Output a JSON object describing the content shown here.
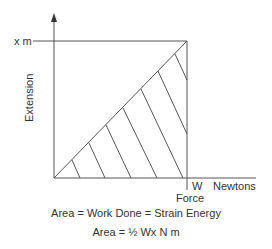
{
  "diagram": {
    "y_axis": {
      "label": "Extension",
      "tick_label": "x m"
    },
    "x_axis": {
      "label": "Force",
      "tick_label": "W",
      "unit": "Newtons"
    },
    "equations": [
      "Area = Work Done = Strain Energy",
      "Area = ½ Wx   N m"
    ],
    "colors": {
      "line": "#555555",
      "text": "#333333",
      "background": "#ffffff"
    }
  }
}
